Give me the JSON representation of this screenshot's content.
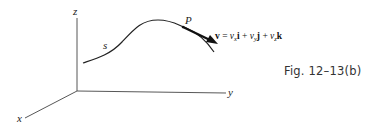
{
  "figure": {
    "caption": "Fig. 12–13(b)",
    "axes": {
      "x_label": "x",
      "y_label": "y",
      "z_label": "z"
    },
    "path_label": "s",
    "point_label": "P",
    "vector": {
      "symbol": "v",
      "equals": "=",
      "terms": [
        {
          "coef": "v",
          "sub": "x",
          "unit": "i"
        },
        {
          "coef": "v",
          "sub": "y",
          "unit": "j"
        },
        {
          "coef": "v",
          "sub": "z",
          "unit": "k"
        }
      ],
      "plus": "+"
    },
    "colors": {
      "line": "#333333",
      "arrow": "#111111",
      "background": "#ffffff"
    }
  }
}
